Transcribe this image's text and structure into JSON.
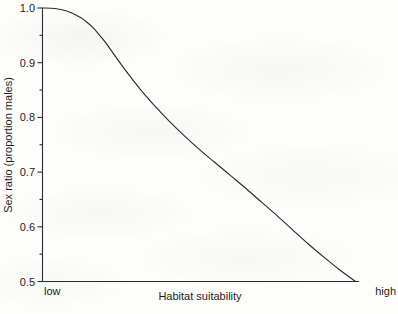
{
  "chart_data": {
    "type": "line",
    "title": "",
    "xlabel": "Habitat suitability",
    "ylabel": "Sex ratio (proportion males)",
    "xlim": [
      0,
      1
    ],
    "ylim": [
      0.5,
      1.0
    ],
    "grid": false,
    "legend": null,
    "x_tick_labels": [
      "low",
      "high"
    ],
    "x_tick_positions": [
      0,
      1
    ],
    "y_major_ticks": [
      1.0,
      0.9,
      0.8,
      0.7,
      0.6,
      0.5
    ],
    "y_major_tick_labels": [
      "1.0",
      "0.9",
      "0.8",
      "0.7",
      "0.6",
      "0.5"
    ],
    "y_minor_ticks": [
      0.95,
      0.85,
      0.75,
      0.65,
      0.55
    ],
    "series": [
      {
        "name": "sex ratio",
        "color": "#2b2b2b",
        "x": [
          0.0,
          0.04,
          0.08,
          0.12,
          0.14,
          0.16,
          0.18,
          0.2,
          0.22,
          0.25,
          0.28,
          0.32,
          0.36,
          0.4,
          0.45,
          0.5,
          0.55,
          0.6,
          0.65,
          0.7,
          0.75,
          0.8,
          0.85,
          0.9,
          0.95,
          1.0
        ],
        "y": [
          1.0,
          0.999,
          0.994,
          0.983,
          0.975,
          0.965,
          0.952,
          0.938,
          0.922,
          0.898,
          0.875,
          0.846,
          0.82,
          0.796,
          0.768,
          0.742,
          0.718,
          0.694,
          0.67,
          0.645,
          0.62,
          0.594,
          0.568,
          0.544,
          0.521,
          0.5
        ]
      }
    ]
  }
}
